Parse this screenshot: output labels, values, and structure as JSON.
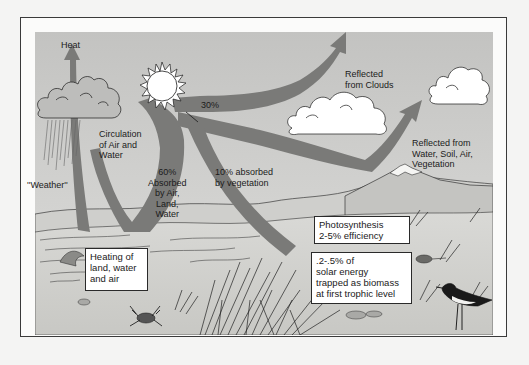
{
  "diagram": {
    "colors": {
      "sky": "#c9c9c7",
      "arrow": "#777775",
      "ground": "#d2d2cf",
      "frame_bg": "#fbfbfa",
      "line": "#2a2a2a"
    },
    "labels": {
      "heat": "Heat",
      "circulation": "Circulation\nof Air and\nWater",
      "weather": "''Weather''",
      "percent_30": "30%",
      "reflected_clouds": "Reflected\nfrom Clouds",
      "reflected_surface": "Reflected from\nWater, Soil, Air,\nVegetation",
      "absorbed_60": "60%\nAbsorbed\nby Air,\nLand,\nWater",
      "absorbed_10": "10% absorbed\nby vegetation"
    },
    "boxes": {
      "heating": "Heating of\nland, water\nand air",
      "photosynthesis": "Photosynthesis\n2-5% efficiency",
      "biomass": ".2-.5% of\nsolar energy\ntrapped as biomass\nat first trophic level"
    },
    "icons": [
      "sun-icon",
      "rain-cloud-icon",
      "cloud-icon",
      "mountain-icon",
      "crab-icon",
      "bird-icon",
      "mouse-icon",
      "grass-icon"
    ]
  }
}
